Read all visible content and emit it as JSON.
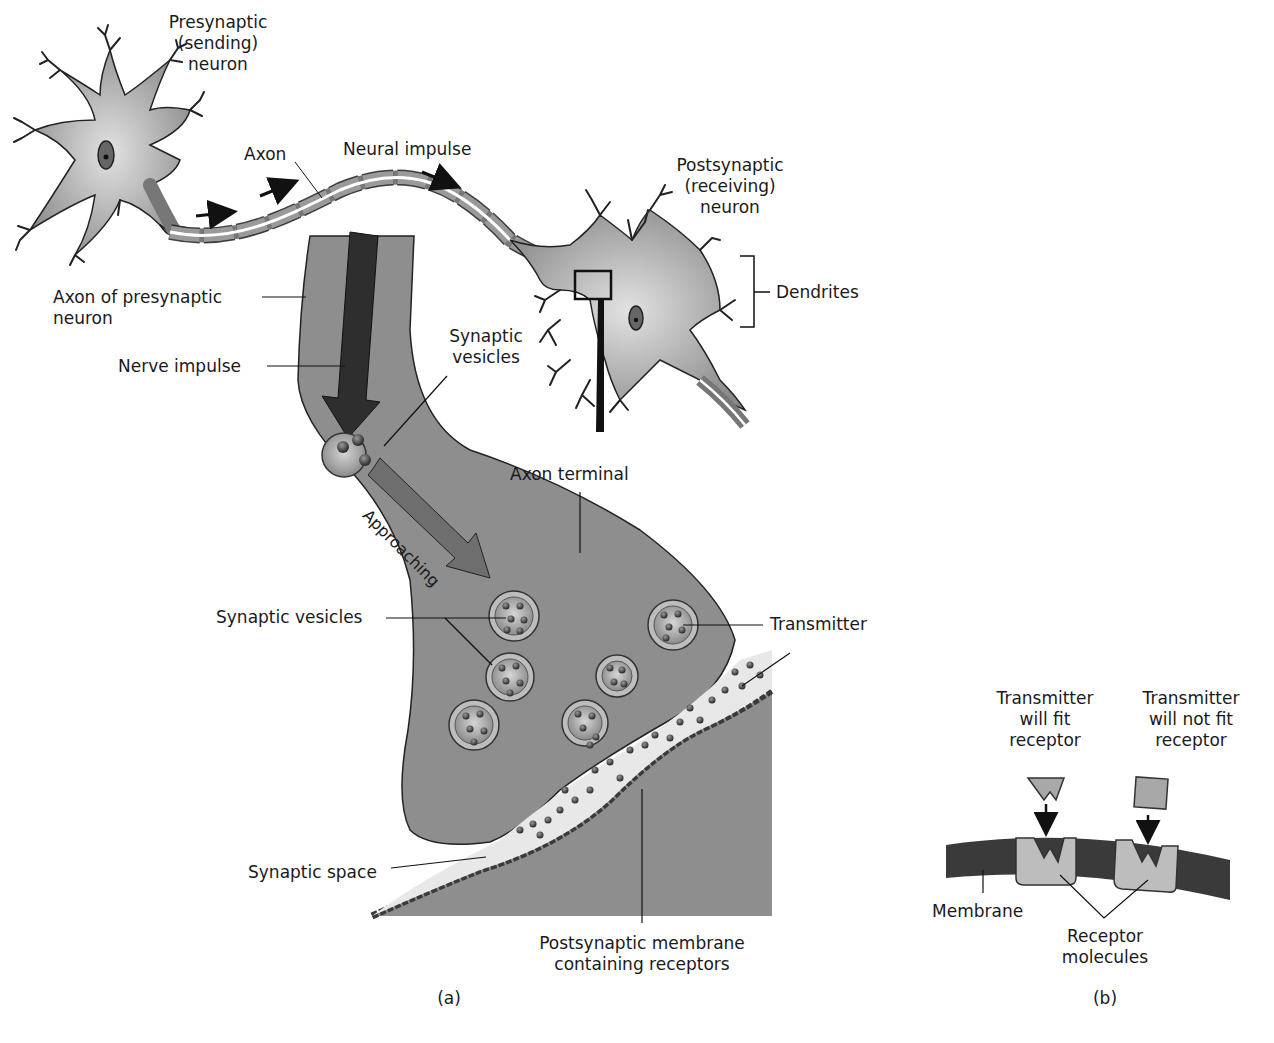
{
  "figure": {
    "panel_a": {
      "caption": "(a)",
      "labels": {
        "presynaptic_neuron": [
          "Presynaptic",
          "(sending)",
          "neuron"
        ],
        "axon": "Axon",
        "neural_impulse": "Neural impulse",
        "postsynaptic_neuron": [
          "Postsynaptic",
          "(receiving)",
          "neuron"
        ],
        "dendrites": "Dendrites",
        "axon_of_presynaptic": [
          "Axon of presynaptic",
          "neuron"
        ],
        "nerve_impulse": "Nerve impulse",
        "synaptic_vesicles_top": [
          "Synaptic",
          "vesicles"
        ],
        "approaching": "Approaching",
        "axon_terminal": "Axon terminal",
        "synaptic_vesicles": "Synaptic vesicles",
        "transmitter": "Transmitter",
        "synaptic_space": "Synaptic space",
        "postsynaptic_membrane": [
          "Postsynaptic membrane",
          "containing receptors"
        ]
      }
    },
    "panel_b": {
      "caption": "(b)",
      "labels": {
        "fit": [
          "Transmitter",
          "will fit",
          "receptor"
        ],
        "not_fit": [
          "Transmitter",
          "will not fit",
          "receptor"
        ],
        "membrane": "Membrane",
        "receptor_molecules": [
          "Receptor",
          "molecules"
        ]
      }
    }
  },
  "colors": {
    "terminal_fill": "#8e8e8e",
    "neuron_fill": "#b8b8b8",
    "myelin": "#9a9a9a",
    "dark": "#3a3a3a",
    "cleft": "#e8e8e8",
    "receptor": "#bdbdbd",
    "line": "#1a1a1a"
  }
}
